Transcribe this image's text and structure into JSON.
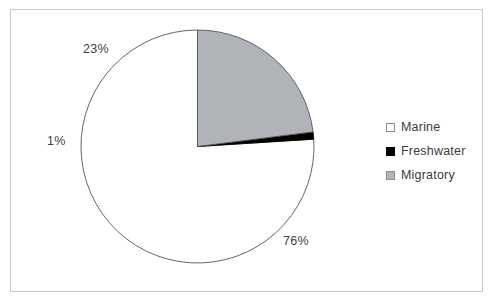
{
  "chart_data": {
    "type": "pie",
    "title": "",
    "categories": [
      "Marine",
      "Freshwater",
      "Migratory"
    ],
    "values": [
      76,
      1,
      23
    ],
    "value_unit": "%",
    "data_labels": [
      "76%",
      "1%",
      "23%"
    ],
    "colors": [
      "#ffffff",
      "#000000",
      "#b0b4b9"
    ],
    "slice_border_color": "#555555",
    "start_angle_deg": 0,
    "direction": "counterclockwise",
    "legend_position": "right",
    "grid": false,
    "xlabel": "",
    "ylabel": ""
  },
  "labels": {
    "marine_pct": "76%",
    "freshwater_pct": "1%",
    "migratory_pct": "23%"
  },
  "legend": {
    "items": [
      {
        "label": "Marine",
        "swatch": "marine-swatch-icon"
      },
      {
        "label": "Freshwater",
        "swatch": "freshwater-swatch-icon"
      },
      {
        "label": "Migratory",
        "swatch": "migratory-swatch-icon"
      }
    ]
  },
  "frame": {
    "border_color": "#c9c9c9",
    "background": "#ffffff"
  }
}
